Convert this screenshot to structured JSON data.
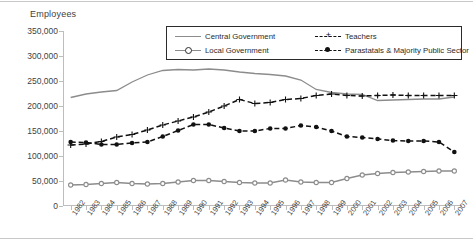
{
  "axis_title": "Employees",
  "legend": {
    "items": [
      {
        "label": "Central Government",
        "marker": "line",
        "color": "#8c8c8c"
      },
      {
        "label": "Local Government",
        "marker": "circle-open",
        "color": "#8c8c8c"
      },
      {
        "label": "Teachers",
        "marker": "plus",
        "color": "#111111"
      },
      {
        "label": "Parastatals & Majority Public Sector",
        "marker": "circle-filled",
        "color": "#111111"
      }
    ]
  },
  "chart_data": {
    "type": "line",
    "title": "",
    "xlabel": "",
    "ylabel": "Employees",
    "ylim": [
      0,
      350000
    ],
    "ytick_step": 50000,
    "grid": false,
    "legend_position": "top-center",
    "ytick_labels": [
      "350,000",
      "300,000",
      "250,000",
      "200,000",
      "150,000",
      "100,000",
      "50,000",
      "0"
    ],
    "categories": [
      "1982",
      "1983",
      "1984",
      "1985",
      "1986",
      "1987",
      "1988",
      "1989",
      "1990",
      "1991",
      "1992",
      "1993",
      "1994",
      "1995",
      "1996",
      "1997",
      "1998",
      "1999",
      "2000",
      "2001",
      "2002",
      "2003",
      "2004",
      "2005",
      "2006",
      "2007"
    ],
    "series": [
      {
        "name": "Central Government",
        "color": "#8c8c8c",
        "marker": "none",
        "dash": false,
        "values": [
          217000,
          224000,
          228000,
          231000,
          248000,
          262000,
          271000,
          273000,
          272000,
          274000,
          272000,
          268000,
          265000,
          263000,
          260000,
          252000,
          233000,
          227000,
          224000,
          223000,
          211000,
          212000,
          213000,
          214000,
          214000,
          218000
        ]
      },
      {
        "name": "Local Government",
        "color": "#8c8c8c",
        "marker": "circle-open",
        "dash": false,
        "values": [
          42000,
          43000,
          45000,
          47000,
          45000,
          44000,
          45000,
          48000,
          51000,
          51000,
          49000,
          47000,
          46000,
          46000,
          52000,
          48000,
          47000,
          47000,
          55000,
          62000,
          65000,
          67000,
          68000,
          69000,
          70000,
          70000
        ]
      },
      {
        "name": "Teachers",
        "color": "#111111",
        "marker": "plus",
        "dash": true,
        "values": [
          122000,
          124000,
          129000,
          138000,
          143000,
          152000,
          162000,
          170000,
          178000,
          188000,
          200000,
          213000,
          205000,
          207000,
          213000,
          215000,
          221000,
          224000,
          221000,
          220000,
          221000,
          222000,
          221000,
          221000,
          221000,
          221000
        ]
      },
      {
        "name": "Parastatals & Majority Public Sector",
        "color": "#111111",
        "marker": "circle-filled",
        "dash": true,
        "values": [
          128000,
          127000,
          123000,
          123000,
          126000,
          128000,
          139000,
          151000,
          163000,
          163000,
          156000,
          150000,
          150000,
          155000,
          155000,
          161000,
          158000,
          150000,
          139000,
          137000,
          134000,
          131000,
          130000,
          130000,
          128000,
          108000
        ]
      }
    ]
  }
}
